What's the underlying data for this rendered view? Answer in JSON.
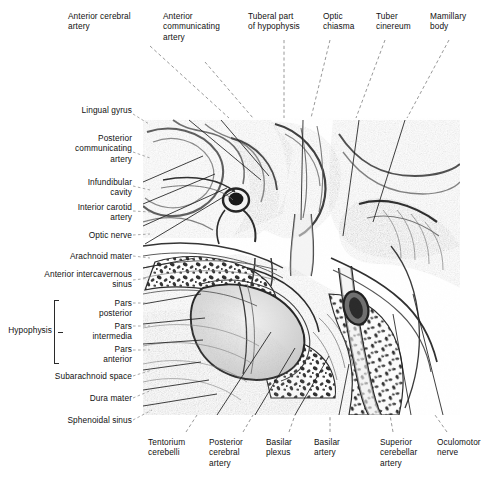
{
  "figure": {
    "style": "grayscale engraving / halftone anatomical plate",
    "plate": {
      "x": 143,
      "y": 118,
      "width": 317,
      "height": 297
    }
  },
  "labels_top": [
    {
      "id": "anterior-cerebral-artery",
      "text": "Anterior cerebral\nartery"
    },
    {
      "id": "anterior-communicating-artery",
      "text": "Anterior\ncommunicating\nartery"
    },
    {
      "id": "tuberal-part-of-hypophysis",
      "text": "Tuberal part\nof hypophysis"
    },
    {
      "id": "optic-chiasma",
      "text": "Optic\nchiasma"
    },
    {
      "id": "tuber-cinereum",
      "text": "Tuber\ncinereum"
    },
    {
      "id": "mamillary-body",
      "text": "Mamillary\nbody"
    }
  ],
  "labels_left": [
    {
      "id": "lingual-gyrus",
      "text": "Lingual gyrus"
    },
    {
      "id": "posterior-communicating-artery",
      "text": "Posterior\ncommunicating\nartery"
    },
    {
      "id": "infundibular-cavity",
      "text": "Infundibular\ncavity"
    },
    {
      "id": "interior-carotid-artery",
      "text": "Interior carotid\nartery"
    },
    {
      "id": "optic-nerve",
      "text": "Optic nerve"
    },
    {
      "id": "arachnoid-mater",
      "text": "Arachnoid mater"
    },
    {
      "id": "anterior-intercavernous-sinus",
      "text": "Anterior intercavernous\nsinus"
    },
    {
      "id": "pars-posterior",
      "text": "Pars\nposterior"
    },
    {
      "id": "pars-intermedia",
      "text": "Pars\nintermedia"
    },
    {
      "id": "pars-anterior",
      "text": "Pars\nanterior"
    },
    {
      "id": "subarachnoid-space",
      "text": "Subarachnoid space"
    },
    {
      "id": "dura-mater",
      "text": "Dura mater"
    },
    {
      "id": "sphenoidal-sinus",
      "text": "Sphenoidal sinus"
    }
  ],
  "bracket_label": {
    "id": "hypophysis",
    "text": "Hypophysis",
    "groups": [
      "pars-posterior",
      "pars-intermedia",
      "pars-anterior"
    ]
  },
  "labels_bottom": [
    {
      "id": "tentorium-cerebelli",
      "text": "Tentorium\ncerebelli"
    },
    {
      "id": "posterior-cerebral-artery",
      "text": "Posterior\ncerebral\nartery"
    },
    {
      "id": "basilar-plexus",
      "text": "Basilar\nplexus"
    },
    {
      "id": "basilar-artery",
      "text": "Basilar\nartery"
    },
    {
      "id": "superior-cerebellar-artery",
      "text": "Superior\ncerebellar\nartery"
    },
    {
      "id": "oculomotor-nerve",
      "text": "Oculomotor\nnerve"
    }
  ],
  "colors": {
    "background": "#ffffff",
    "text": "#111111",
    "leader_line": "#8d8d8d",
    "bracket": "#2a2a2a",
    "plate_ink": "#4a4a4a",
    "plate_dark": "#1d1d1d",
    "plate_mid": "#8e8e8e",
    "plate_light": "#d8d8d8"
  }
}
